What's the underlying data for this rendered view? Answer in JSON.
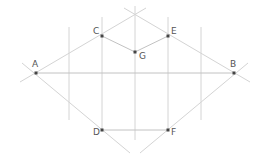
{
  "diagram": {
    "colors": {
      "line": "#d4d4d4",
      "segment": "#c2c2c2",
      "point": "#444444",
      "label": "#555555"
    },
    "points": [
      {
        "id": "A",
        "label": "A",
        "x": 36,
        "y": 73,
        "lx": 32,
        "ly": 67
      },
      {
        "id": "B",
        "label": "B",
        "x": 234,
        "y": 73,
        "lx": 230,
        "ly": 67
      },
      {
        "id": "C",
        "label": "C",
        "x": 102,
        "y": 36,
        "lx": 93,
        "ly": 34
      },
      {
        "id": "E",
        "label": "E",
        "x": 168,
        "y": 36,
        "lx": 171,
        "ly": 34
      },
      {
        "id": "G",
        "label": "G",
        "x": 135,
        "y": 52,
        "lx": 139,
        "ly": 59
      },
      {
        "id": "D",
        "label": "D",
        "x": 102,
        "y": 130,
        "lx": 93,
        "ly": 135
      },
      {
        "id": "F",
        "label": "F",
        "x": 168,
        "y": 130,
        "lx": 171,
        "ly": 135
      }
    ],
    "segments": [
      {
        "name": "segment-c-g",
        "x1": 102,
        "y1": 36,
        "x2": 135,
        "y2": 52
      },
      {
        "name": "segment-g-e",
        "x1": 135,
        "y1": 52,
        "x2": 168,
        "y2": 36
      },
      {
        "name": "segment-d-f",
        "x1": 102,
        "y1": 130,
        "x2": 168,
        "y2": 130
      },
      {
        "name": "segment-a-b",
        "x1": 36,
        "y1": 73,
        "x2": 234,
        "y2": 73
      }
    ],
    "lines": [
      {
        "name": "line-a-apex",
        "x1": 20,
        "y1": 82,
        "x2": 146,
        "y2": 8
      },
      {
        "name": "line-b-apex",
        "x1": 250,
        "y1": 82,
        "x2": 124,
        "y2": 8
      },
      {
        "name": "line-a-bottom",
        "x1": 22,
        "y1": 63,
        "x2": 130,
        "y2": 153
      },
      {
        "name": "line-b-bottom",
        "x1": 248,
        "y1": 63,
        "x2": 140,
        "y2": 153
      },
      {
        "name": "vertical-line-1",
        "x1": 69,
        "y1": 27,
        "x2": 69,
        "y2": 120
      },
      {
        "name": "vertical-line-2",
        "x1": 102,
        "y1": 17,
        "x2": 102,
        "y2": 130
      },
      {
        "name": "vertical-line-3",
        "x1": 135,
        "y1": 6,
        "x2": 135,
        "y2": 140
      },
      {
        "name": "vertical-line-4",
        "x1": 168,
        "y1": 17,
        "x2": 168,
        "y2": 130
      },
      {
        "name": "vertical-line-5",
        "x1": 201,
        "y1": 27,
        "x2": 201,
        "y2": 120
      }
    ]
  }
}
